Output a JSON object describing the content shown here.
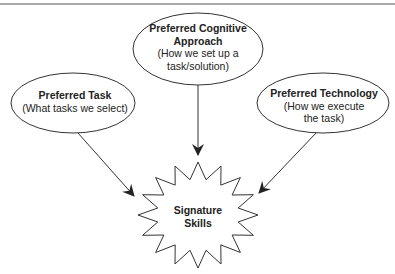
{
  "diagram": {
    "type": "flow",
    "nodes": [
      {
        "id": "cognitive",
        "title_lines": [
          "Preferred Cognitive",
          "Approach"
        ],
        "sub_lines": [
          "(How we set up a",
          "task/solution)"
        ],
        "shape": "ellipse"
      },
      {
        "id": "task",
        "title_lines": [
          "Preferred Task"
        ],
        "sub_lines": [
          "(What tasks we select)"
        ],
        "shape": "ellipse"
      },
      {
        "id": "technology",
        "title_lines": [
          "Preferred Technology"
        ],
        "sub_lines": [
          "(How we execute",
          "the task)"
        ],
        "shape": "ellipse"
      },
      {
        "id": "signature",
        "title_lines": [
          "Signature",
          "Skills"
        ],
        "sub_lines": [],
        "shape": "starburst"
      }
    ],
    "edges": [
      {
        "from": "task",
        "to": "signature"
      },
      {
        "from": "cognitive",
        "to": "signature"
      },
      {
        "from": "technology",
        "to": "signature"
      }
    ],
    "colors": {
      "stroke": "#333333",
      "text": "#222222",
      "rule": "#555555",
      "background": "#ffffff"
    }
  }
}
